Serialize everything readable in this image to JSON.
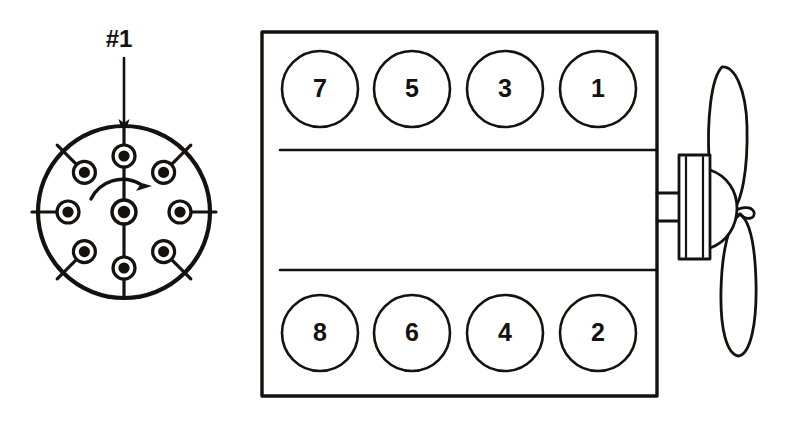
{
  "diagram": {
    "ink_color": "#14110f",
    "background_color": "#ffffff"
  },
  "distributor": {
    "name": "distributor-cap",
    "pointer_label": "#1",
    "rotation_direction": "clockwise",
    "center_terminal_label": "",
    "geometry": {
      "cx": 124,
      "cy": 212,
      "radius": 86,
      "terminal_ring_radius": 56,
      "terminal_outer_radius": 11,
      "terminal_inner_radius": 5.5,
      "center_terminal_outer_radius": 12,
      "center_terminal_inner_radius": 6
    },
    "terminals": [
      {
        "name": "terminal-top",
        "angle_deg": -90
      },
      {
        "name": "terminal-upper-right",
        "angle_deg": -45
      },
      {
        "name": "terminal-right",
        "angle_deg": 0
      },
      {
        "name": "terminal-lower-right",
        "angle_deg": 45
      },
      {
        "name": "terminal-bottom",
        "angle_deg": 90
      },
      {
        "name": "terminal-lower-left",
        "angle_deg": 135
      },
      {
        "name": "terminal-left",
        "angle_deg": 180
      },
      {
        "name": "terminal-upper-left",
        "angle_deg": -135
      }
    ],
    "pointer": {
      "label": "#1",
      "label_x": 119,
      "label_y": 41,
      "arrow_x": 124,
      "arrow_top_y": 58,
      "arrow_tip_y": 136
    }
  },
  "engine": {
    "name": "engine-block",
    "block": {
      "x": 262,
      "y": 32,
      "width": 395,
      "height": 364
    },
    "divider_lines": [
      {
        "name": "head-divider-upper",
        "y": 150,
        "x1": 280,
        "x2": 657
      },
      {
        "name": "head-divider-lower",
        "y": 270,
        "x1": 280,
        "x2": 657
      }
    ],
    "cylinder_radius": 38,
    "rows": [
      {
        "name": "cylinder-bank-top",
        "cy": 89,
        "cylinders": [
          {
            "label": "7",
            "cx": 320
          },
          {
            "label": "5",
            "cx": 412
          },
          {
            "label": "3",
            "cx": 505
          },
          {
            "label": "1",
            "cx": 598
          }
        ]
      },
      {
        "name": "cylinder-bank-bottom",
        "cy": 333,
        "cylinders": [
          {
            "label": "8",
            "cx": 320
          },
          {
            "label": "6",
            "cx": 412
          },
          {
            "label": "4",
            "cx": 505
          },
          {
            "label": "2",
            "cx": 598
          }
        ]
      }
    ]
  },
  "fan_assembly": {
    "name": "cooling-fan-assembly",
    "shaft": {
      "x1": 657,
      "x2": 679,
      "y_top": 193,
      "y_bottom": 221
    },
    "pulley": {
      "x": 679,
      "y": 155,
      "width": 31,
      "height": 104
    },
    "hub": {
      "cx": 711,
      "cy": 207,
      "rx": 24,
      "ry": 37
    },
    "blades": [
      {
        "name": "fan-blade-upper"
      },
      {
        "name": "fan-blade-lower"
      }
    ]
  }
}
